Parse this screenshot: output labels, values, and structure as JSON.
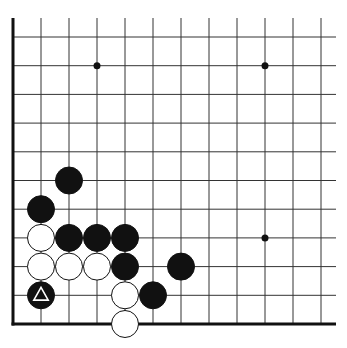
{
  "board": {
    "description": "Go board corner diagram (lower-left corner)",
    "grid": {
      "origin_x": 13,
      "origin_y": 324,
      "spacing_x": 28,
      "spacing_y": 28.7,
      "cols": 12,
      "rows": 11,
      "top_y": 18,
      "right_x": 336
    },
    "colors": {
      "background": "#ffffff",
      "line": "#333333",
      "black_stone": "#111111",
      "white_stone": "#ffffff"
    },
    "star_points": [
      {
        "col": 3,
        "row": 9
      },
      {
        "col": 9,
        "row": 9
      },
      {
        "col": 9,
        "row": 3
      }
    ],
    "stones": [
      {
        "color": "black",
        "col": 2,
        "row": 5
      },
      {
        "color": "black",
        "col": 1,
        "row": 4
      },
      {
        "color": "white",
        "col": 1,
        "row": 3
      },
      {
        "color": "black",
        "col": 2,
        "row": 3
      },
      {
        "color": "black",
        "col": 3,
        "row": 3
      },
      {
        "color": "black",
        "col": 4,
        "row": 3
      },
      {
        "color": "white",
        "col": 1,
        "row": 2
      },
      {
        "color": "white",
        "col": 2,
        "row": 2
      },
      {
        "color": "white",
        "col": 3,
        "row": 2
      },
      {
        "color": "black",
        "col": 4,
        "row": 2
      },
      {
        "color": "black",
        "col": 6,
        "row": 2
      },
      {
        "color": "black",
        "col": 1,
        "row": 1,
        "marker": "triangle"
      },
      {
        "color": "white",
        "col": 4,
        "row": 1
      },
      {
        "color": "black",
        "col": 5,
        "row": 1
      },
      {
        "color": "white",
        "col": 4,
        "row": 0
      }
    ]
  }
}
